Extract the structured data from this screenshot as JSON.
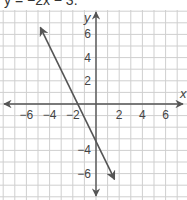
{
  "title": "y = −2x − 3.",
  "chart_data": {
    "type": "line",
    "title": "y = −2x − 3",
    "xlabel": "x",
    "ylabel": "y",
    "xlim": [
      -8,
      8
    ],
    "ylim": [
      -8,
      8
    ],
    "grid": true,
    "x_ticks": [
      "-6",
      "-4",
      "-2",
      "2",
      "4",
      "6"
    ],
    "y_ticks": [
      "6",
      "4",
      "2",
      "-4",
      "-6"
    ],
    "series": [
      {
        "name": "y = -2x - 3",
        "x": [
          -4.8,
          1.6
        ],
        "y": [
          6.6,
          -6.5
        ],
        "slope": -2,
        "intercept": -3,
        "arrows": "both"
      }
    ],
    "colors": {
      "line": "#555555",
      "grid": "#cfcfcf",
      "axis": "#555555"
    }
  }
}
